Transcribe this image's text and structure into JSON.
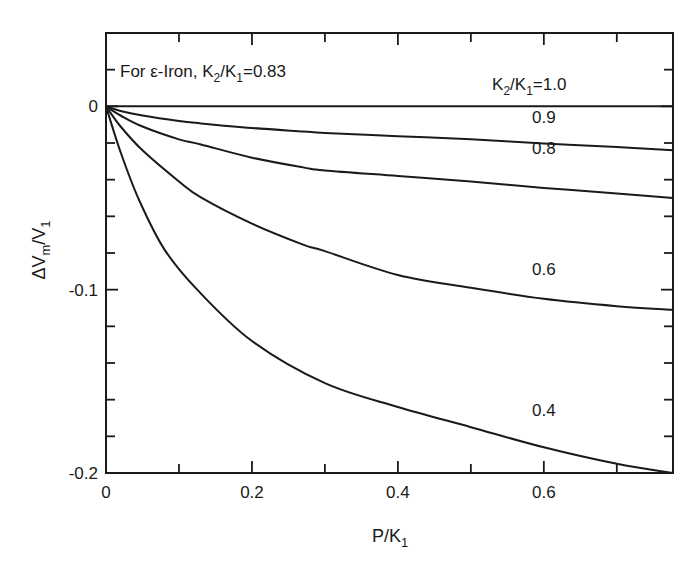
{
  "chart_data": {
    "type": "line",
    "title": "",
    "xlabel": {
      "main": "P/K",
      "sub": "1"
    },
    "ylabel": {
      "main": "ΔV",
      "sub1": "m",
      "mid": "/V",
      "sub2": "1"
    },
    "xlim": [
      0,
      0.777
    ],
    "ylim": [
      -0.2,
      0.04
    ],
    "xticks_major": [
      0,
      0.2,
      0.4,
      0.6
    ],
    "xtick_labels": [
      "0",
      "0.2",
      "0.4",
      "0.6"
    ],
    "xticks_minor": [
      0.1,
      0.3,
      0.5,
      0.7
    ],
    "yticks_major": [
      0,
      -0.1,
      -0.2
    ],
    "ytick_labels": [
      "0",
      "-0.1",
      "-0.2"
    ],
    "yticks_minor": [
      0.02,
      -0.02,
      -0.04,
      -0.06,
      -0.08,
      -0.12,
      -0.14,
      -0.16,
      -0.18
    ],
    "grid": false,
    "annotation": {
      "prefix": "For ε-Iron, K",
      "sub1": "2",
      "mid": "/K",
      "sub2": "1",
      "suffix": "=0.83"
    },
    "series": [
      {
        "name": "K2/K1=1.0",
        "label": {
          "pre": "K",
          "s1": "2",
          "mid": "/K",
          "s2": "1",
          "post": "=1.0"
        },
        "x": [
          0,
          0.1,
          0.2,
          0.3,
          0.4,
          0.5,
          0.6,
          0.7,
          0.777
        ],
        "y": [
          0,
          0,
          0,
          0,
          0,
          0,
          0,
          0,
          0
        ]
      },
      {
        "name": "0.9",
        "label": {
          "pre": "0.9"
        },
        "x": [
          0,
          0.02,
          0.05,
          0.1,
          0.13,
          0.2,
          0.27,
          0.3,
          0.4,
          0.5,
          0.6,
          0.7,
          0.777
        ],
        "y": [
          0,
          -0.0025,
          -0.005,
          -0.008,
          -0.0093,
          -0.0118,
          -0.0137,
          -0.0145,
          -0.0163,
          -0.018,
          -0.0203,
          -0.0222,
          -0.024
        ]
      },
      {
        "name": "0.8",
        "label": {
          "pre": "0.8"
        },
        "x": [
          0,
          0.02,
          0.05,
          0.1,
          0.13,
          0.2,
          0.27,
          0.3,
          0.4,
          0.5,
          0.6,
          0.7,
          0.777
        ],
        "y": [
          0,
          -0.005,
          -0.011,
          -0.018,
          -0.0208,
          -0.028,
          -0.0333,
          -0.035,
          -0.038,
          -0.041,
          -0.0445,
          -0.0475,
          -0.05
        ]
      },
      {
        "name": "0.6",
        "label": {
          "pre": "0.6"
        },
        "x": [
          0,
          0.02,
          0.05,
          0.1,
          0.13,
          0.2,
          0.27,
          0.3,
          0.4,
          0.5,
          0.6,
          0.7,
          0.777
        ],
        "y": [
          0,
          -0.011,
          -0.024,
          -0.041,
          -0.0497,
          -0.064,
          -0.0754,
          -0.079,
          -0.092,
          -0.099,
          -0.105,
          -0.109,
          -0.111
        ]
      },
      {
        "name": "0.4",
        "label": {
          "pre": "0.4"
        },
        "x": [
          0,
          0.02,
          0.045,
          0.08,
          0.125,
          0.2,
          0.3,
          0.4,
          0.5,
          0.6,
          0.7,
          0.777
        ],
        "y": [
          0,
          -0.025,
          -0.0508,
          -0.078,
          -0.1,
          -0.128,
          -0.151,
          -0.164,
          -0.175,
          -0.186,
          -0.195,
          -0.2
        ]
      }
    ]
  }
}
